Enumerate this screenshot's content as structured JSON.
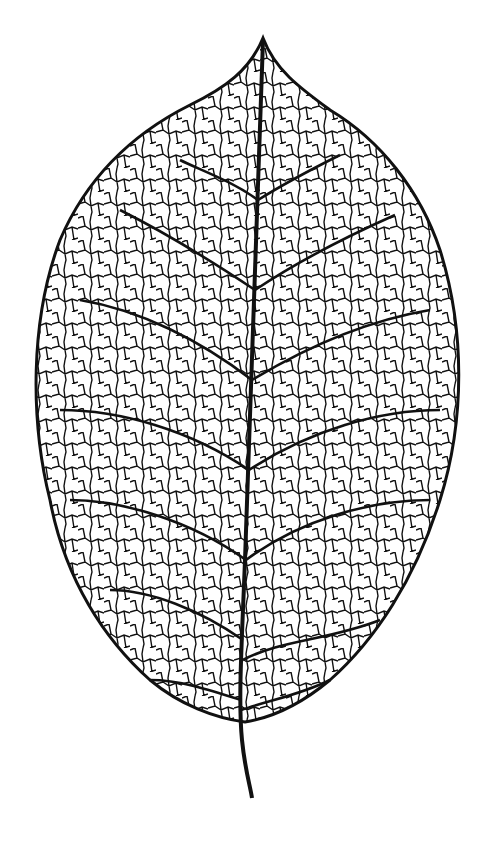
{
  "illustration": {
    "subject": "leaf skeleton line art",
    "colors": {
      "background": "#ffffff",
      "ink": "#111111"
    }
  }
}
